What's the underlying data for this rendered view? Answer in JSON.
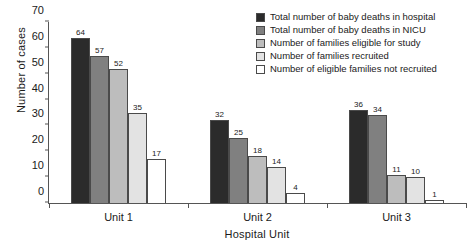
{
  "chart_data": {
    "type": "bar",
    "title": "",
    "subtitle": "",
    "xlabel": "Hospital Unit",
    "ylabel": "Number of cases",
    "categories": [
      "Unit 1",
      "Unit 2",
      "Unit 3"
    ],
    "ylim": [
      0,
      70
    ],
    "yticks": [
      0,
      10,
      20,
      30,
      40,
      50,
      60,
      70
    ],
    "grid": false,
    "legend_position": "top-right",
    "series": [
      {
        "name": "Total number of baby deaths in hospital",
        "color": "#2b2b2b",
        "values": [
          64,
          32,
          36
        ]
      },
      {
        "name": "Total number of baby deaths in NICU",
        "color": "#808080",
        "values": [
          57,
          25,
          34
        ]
      },
      {
        "name": "Number of families eligible for study",
        "color": "#bdbdbd",
        "values": [
          52,
          18,
          11
        ]
      },
      {
        "name": "Number of families recruited",
        "color": "#e3e3e3",
        "values": [
          35,
          14,
          10
        ]
      },
      {
        "name": "Number of eligible families not recruited",
        "color": "#ffffff",
        "values": [
          17,
          4,
          1
        ]
      }
    ]
  },
  "axis_colors": {
    "axis_line": "#555555",
    "bar_outline": "#4a4a4a",
    "text": "#1a1a1a"
  }
}
